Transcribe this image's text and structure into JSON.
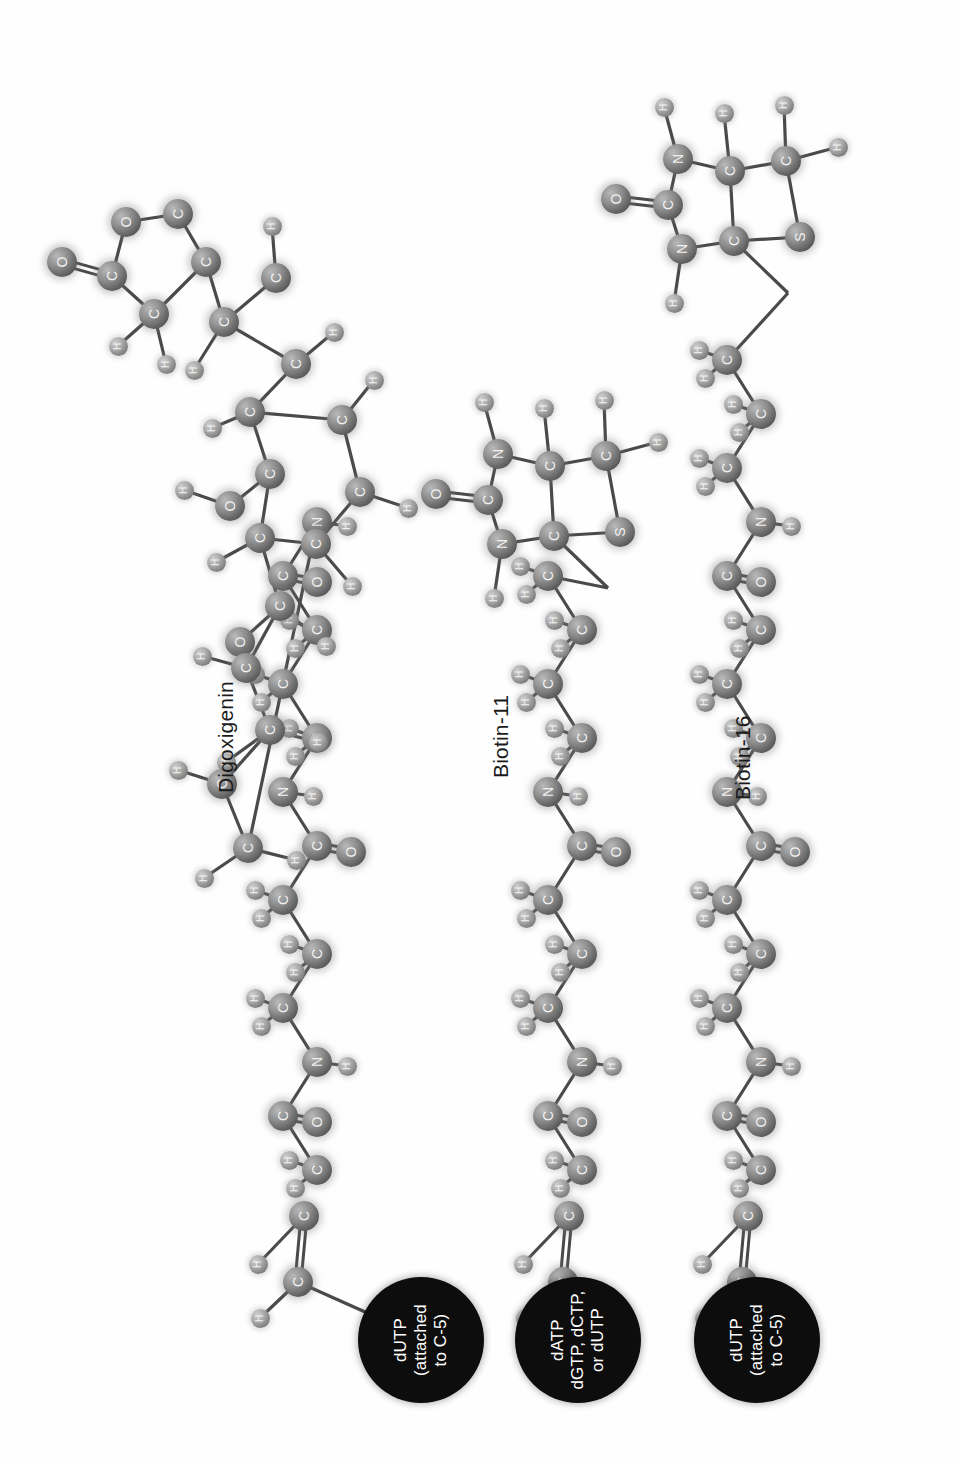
{
  "figure": {
    "background_color": "#ffffff",
    "orientation": "rotated-90",
    "render_style": "ball-and-stick space-filled spheres with drop shadow"
  },
  "palette": {
    "background": "#ffffff",
    "atom_heavy_fill": "#7d7d7d",
    "atom_hydrogen_fill": "#a8a8a8",
    "atom_label_color": "#f2f2f2",
    "bond_color": "#4a4a4a",
    "nucleotide_circle_fill": "#0d0d0d",
    "nucleotide_text_color": "#ffffff",
    "label_text_color": "#1b1b1b"
  },
  "molecules": [
    {
      "id": "digoxigenin",
      "label": "Digoxigenin",
      "label_x": 214,
      "label_y": 793,
      "nucleotide": {
        "text": "dUTP\n(attached\nto C-5)",
        "cx": 421,
        "cy": 1340,
        "r": 63
      },
      "atom_labels": [
        "O",
        "C",
        "H",
        "N"
      ],
      "description": "Digoxigenin steroid haptens linked by a spacer arm of amide linkages to dUTP"
    },
    {
      "id": "biotin-11",
      "label": "Biotin-11",
      "label_x": 489,
      "label_y": 778,
      "nucleotide": {
        "text": "dATP\ndGTP, dCTP,\nor dUTP",
        "cx": 578,
        "cy": 1340,
        "r": 63
      },
      "atom_labels": [
        "O",
        "C",
        "H",
        "N",
        "S"
      ],
      "description": "Biotin bicyclic ring with 11-atom spacer arm to a deoxyribonucleoside triphosphate"
    },
    {
      "id": "biotin-16",
      "label": "Biotin-16",
      "label_x": 731,
      "label_y": 800,
      "nucleotide": {
        "text": "dUTP\n(attached\nto C-5)",
        "cx": 757,
        "cy": 1340,
        "r": 63
      },
      "atom_labels": [
        "O",
        "C",
        "H",
        "N",
        "S"
      ],
      "description": "Biotin bicyclic ring with 16-atom spacer arm to dUTP"
    }
  ],
  "atom_element_legend": {
    "C": "carbon",
    "O": "oxygen",
    "N": "nitrogen",
    "S": "sulfur",
    "H": "hydrogen"
  }
}
